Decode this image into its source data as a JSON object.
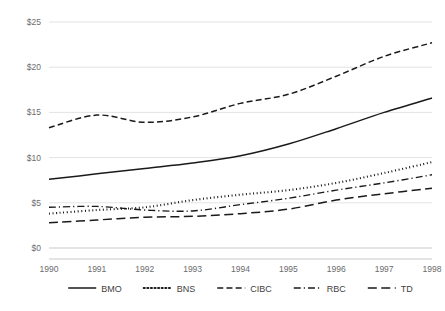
{
  "chart_data": {
    "type": "line",
    "title": "",
    "subtitle": "",
    "xlabel": "",
    "ylabel": "",
    "grid": true,
    "legend_position": "bottom",
    "x": [
      1990,
      1991,
      1992,
      1993,
      1994,
      1995,
      1996,
      1997,
      1998
    ],
    "categories": [
      "1990",
      "1991",
      "1992",
      "1993",
      "1994",
      "1995",
      "1996",
      "1997",
      "1998"
    ],
    "xtick_labels": [
      "1990",
      "1991",
      "1992",
      "1993",
      "1994",
      "1995",
      "1996",
      "1997",
      "1998"
    ],
    "ytick_labels": [
      "$0",
      "$5",
      "$10",
      "$15",
      "$20",
      "$25"
    ],
    "ytick_values": [
      0,
      5,
      10,
      15,
      20,
      25
    ],
    "ylim": [
      0,
      25
    ],
    "xlim": [
      1990,
      1998
    ],
    "series": [
      {
        "name": "BMO",
        "dash": "solid",
        "color": "#1a1a1a",
        "values": [
          7.6,
          8.2,
          8.8,
          9.4,
          10.2,
          11.5,
          13.2,
          15.0,
          16.6
        ]
      },
      {
        "name": "BNS",
        "dash": "dotted",
        "color": "#1a1a1a",
        "values": [
          3.8,
          4.2,
          4.5,
          5.3,
          5.9,
          6.4,
          7.2,
          8.3,
          9.5
        ]
      },
      {
        "name": "CIBC",
        "dash": "dashed",
        "color": "#1a1a1a",
        "values": [
          13.3,
          14.7,
          13.9,
          14.5,
          16.0,
          17.0,
          19.0,
          21.2,
          22.7
        ]
      },
      {
        "name": "RBC",
        "dash": "dashdot",
        "color": "#1a1a1a",
        "values": [
          4.5,
          4.6,
          4.2,
          4.1,
          4.8,
          5.5,
          6.4,
          7.2,
          8.1
        ]
      },
      {
        "name": "TD",
        "dash": "longdash",
        "color": "#1a1a1a",
        "values": [
          2.8,
          3.1,
          3.4,
          3.5,
          3.8,
          4.3,
          5.3,
          6.0,
          6.6
        ]
      }
    ]
  },
  "legend": {
    "items": [
      {
        "label": "BMO",
        "dash": "solid"
      },
      {
        "label": "BNS",
        "dash": "dotted"
      },
      {
        "label": "CIBC",
        "dash": "dashed"
      },
      {
        "label": "RBC",
        "dash": "dashdot"
      },
      {
        "label": "TD",
        "dash": "longdash"
      }
    ]
  },
  "colors": {
    "line": "#1a1a1a",
    "grid": "#e3e3e5",
    "axis": "#c9c9cc",
    "tick_text": "#6b6b6e",
    "legend_text": "#3f3f42",
    "background": "#ffffff"
  }
}
